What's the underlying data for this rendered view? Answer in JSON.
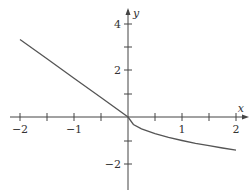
{
  "chart_data": {
    "type": "line",
    "title": "",
    "xlabel": "x",
    "ylabel": "y",
    "xlim": [
      -2,
      2
    ],
    "ylim": [
      -3,
      4.5
    ],
    "grid": false,
    "x_ticks": [
      -2,
      -1.5,
      -1,
      -0.5,
      0.5,
      1,
      1.5,
      2
    ],
    "x_tick_labels": [
      "-2",
      "",
      "-1",
      "",
      "",
      "1",
      "",
      "2"
    ],
    "y_ticks": [
      -2,
      -1,
      1,
      2,
      3,
      4
    ],
    "y_tick_labels": [
      "-2",
      "",
      "",
      "2",
      "",
      "4"
    ],
    "series": [
      {
        "name": "f(x)",
        "x": [
          -2,
          -1.5,
          -1,
          -0.5,
          0,
          0.1,
          0.25,
          0.5,
          0.75,
          1,
          1.25,
          1.5,
          1.75,
          2
        ],
        "values": [
          3.3,
          2.48,
          1.65,
          0.83,
          0,
          -0.32,
          -0.5,
          -0.71,
          -0.87,
          -1.0,
          -1.12,
          -1.22,
          -1.32,
          -1.41
        ]
      }
    ]
  },
  "labels": {
    "x_axis": "x",
    "y_axis": "y",
    "xm2": "−2",
    "xm1": "−1",
    "x1": "1",
    "x2": "2",
    "y4": "4",
    "y2": "2",
    "ym2": "−2"
  }
}
